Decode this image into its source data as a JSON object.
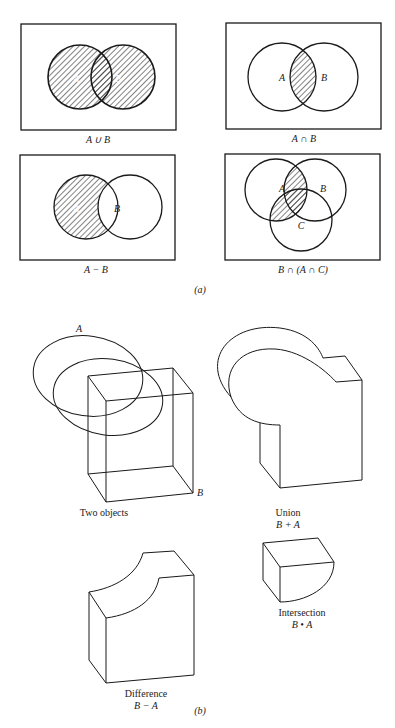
{
  "figure": {
    "part_a": {
      "label": "(a)",
      "panels": [
        {
          "caption": "A ∪ B",
          "set_labels": [
            "A",
            "B"
          ],
          "operation": "union"
        },
        {
          "caption": "A ∩ B",
          "set_labels": [
            "A",
            "B"
          ],
          "operation": "intersection"
        },
        {
          "caption": "A − B",
          "set_labels": [
            "A",
            "B"
          ],
          "operation": "difference"
        },
        {
          "caption": "B ∩ (A ∩ C)",
          "set_labels": [
            "A",
            "B",
            "C"
          ],
          "operation": "triple-intersection"
        }
      ]
    },
    "part_b": {
      "label": "(b)",
      "two_objects": {
        "caption": "Two objects",
        "label_a": "A",
        "label_b": "B"
      },
      "union": {
        "title": "Union",
        "expr": "B + A"
      },
      "intersection": {
        "title": "Intersection",
        "expr": "B • A"
      },
      "difference": {
        "title": "Difference",
        "expr": "B − A"
      }
    }
  }
}
